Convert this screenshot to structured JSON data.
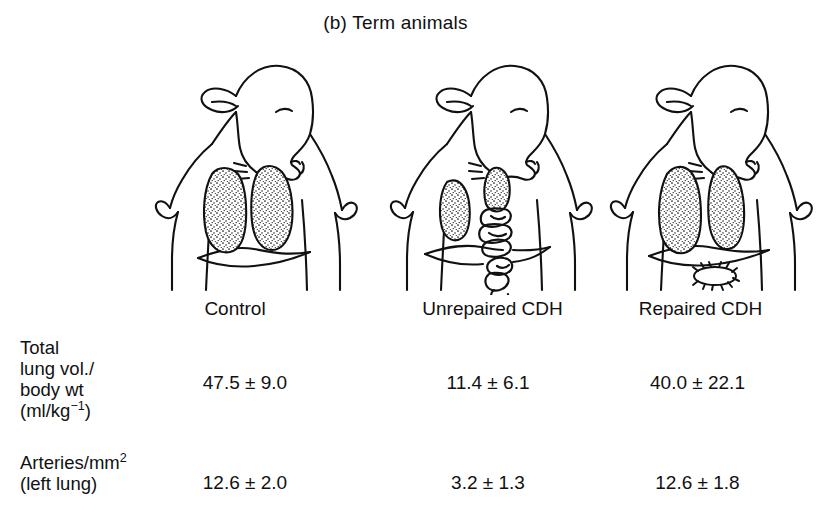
{
  "figure": {
    "panel_label": "(b) Term animals",
    "ink_color": "#111111",
    "background_color": "#ffffff"
  },
  "diagrams": [
    {
      "id": "control",
      "name": "lamb-torso-control",
      "caption": "Control",
      "description": "Term lamb, frontal view with head turned right, two large stippled lungs filling the thorax above an intact diaphragm",
      "lungs": "two-large-stippled-lungs",
      "diaphragm": "intact",
      "bowel": "none",
      "repair_patch": "none"
    },
    {
      "id": "unrepaired",
      "name": "lamb-torso-unrepaired-cdh",
      "caption": "Unrepaired CDH",
      "description": "Term lamb with congenital diaphragmatic hernia; both lungs hypoplastic, coils of herniated bowel occupy the left hemithorax and pass through the diaphragmatic defect",
      "lungs": "two-small-hypoplastic-lungs",
      "diaphragm": "defect",
      "bowel": "herniated-bowel-loops",
      "repair_patch": "none"
    },
    {
      "id": "repaired",
      "name": "lamb-torso-repaired-cdh",
      "caption": "Repaired CDH",
      "description": "Term lamb after in-utero repair; both lungs near normal size, sutured diaphragm repair site visible below the diaphragm",
      "lungs": "two-near-normal-stippled-lungs",
      "diaphragm": "repaired",
      "bowel": "none",
      "repair_patch": "sutured-oval-repair-site"
    }
  ],
  "table": {
    "column_headers": [
      "Control",
      "Unrepaired CDH",
      "Repaired CDH"
    ],
    "rows": [
      {
        "label_lines": [
          "Total",
          "lung vol./",
          "body wt",
          "(ml/kg"
        ],
        "label_superscript": "−1",
        "label_suffix": ")",
        "values": [
          "47.5 ± 9.0",
          "11.4 ± 6.1",
          "40.0 ± 22.1"
        ]
      },
      {
        "label_lines": [
          "Arteries/mm"
        ],
        "label_superscript": "2",
        "label_line2": "(left lung)",
        "values": [
          "12.6 ± 2.0",
          "3.2 ± 1.3",
          "12.6 ± 1.8"
        ]
      }
    ]
  }
}
